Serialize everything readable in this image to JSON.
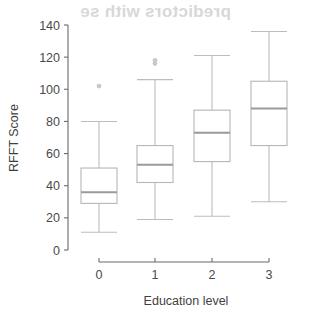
{
  "figure": {
    "background_color": "#ffffff",
    "ghost_text": "predictors with se"
  },
  "chart_data": {
    "type": "box",
    "title": "",
    "xlabel": "Education level",
    "ylabel": "RFFT Score",
    "categories": [
      "0",
      "1",
      "2",
      "3"
    ],
    "xtick_labels": [
      "0",
      "1",
      "2",
      "3"
    ],
    "ytick_labels": [
      "0",
      "20",
      "40",
      "60",
      "80",
      "100",
      "120",
      "140"
    ],
    "yticks": [
      0,
      20,
      40,
      60,
      80,
      100,
      120,
      140
    ],
    "ylim": [
      0,
      140
    ],
    "grid": false,
    "legend": false,
    "boxes": [
      {
        "category": "0",
        "min": 11,
        "q1": 29,
        "median": 36,
        "q3": 51,
        "max": 80,
        "outliers": [
          102
        ]
      },
      {
        "category": "1",
        "min": 19,
        "q1": 42,
        "median": 53,
        "q3": 65,
        "max": 106,
        "outliers": [
          116,
          118
        ]
      },
      {
        "category": "2",
        "min": 21,
        "q1": 55,
        "median": 73,
        "q3": 87,
        "max": 121,
        "outliers": []
      },
      {
        "category": "3",
        "min": 30,
        "q1": 65,
        "median": 88,
        "q3": 105,
        "max": 136,
        "outliers": []
      }
    ],
    "colors": {
      "box_stroke": "#b6b6b8",
      "median": "#9a9a9c",
      "whisker": "#bcbcbe",
      "outlier": "#c9c9cb",
      "axis": "#6b6b6b",
      "text": "#4a4a4a"
    }
  }
}
